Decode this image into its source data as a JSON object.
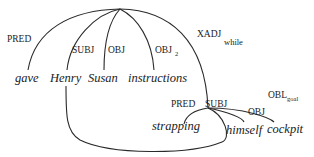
{
  "diagram": {
    "type": "dependency-structure",
    "nodes": {
      "root": {
        "words": [
          "gave",
          "Henry",
          "Susan",
          "instructions"
        ]
      },
      "xadj": {
        "words": [
          "strapping",
          "himself",
          "cockpit"
        ]
      }
    },
    "words": {
      "gave": "gave",
      "henry": "Henry",
      "susan": "Susan",
      "instructions": "instructions",
      "strapping": "strapping",
      "himself": "himself",
      "cockpit": "cockpit"
    },
    "relations": {
      "pred1": "PRED",
      "subj1": "SUBJ",
      "obj1": "OBJ",
      "obj2": "OBJ",
      "obj2_sub": "2",
      "xadj": "XADJ",
      "xadj_sub": "while",
      "pred2": "PRED",
      "subj2": "SUBJ",
      "obj3": "OBJ",
      "obl": "OBL",
      "obl_sub": "goal"
    },
    "edges": [
      {
        "from": "root",
        "to": "gave",
        "label": "PRED"
      },
      {
        "from": "root",
        "to": "Henry",
        "label": "SUBJ"
      },
      {
        "from": "root",
        "to": "Susan",
        "label": "OBJ"
      },
      {
        "from": "root",
        "to": "instructions",
        "label": "OBJ_2"
      },
      {
        "from": "root",
        "to": "xadj",
        "label": "XADJ_while"
      },
      {
        "from": "xadj",
        "to": "strapping",
        "label": "PRED"
      },
      {
        "from": "xadj",
        "to": "Henry",
        "label": "SUBJ",
        "note": "structure-shared (control)"
      },
      {
        "from": "xadj",
        "to": "himself",
        "label": "OBJ"
      },
      {
        "from": "xadj",
        "to": "cockpit",
        "label": "OBL_goal"
      }
    ]
  }
}
